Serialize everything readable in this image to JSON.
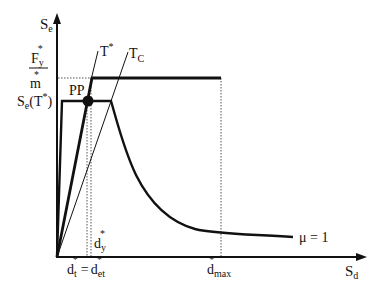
{
  "diagram": {
    "title": "",
    "axes": {
      "y_label": "S",
      "y_label_sub": "e",
      "x_label": "S",
      "x_label_sub": "d"
    },
    "labels": {
      "fy_num": "F",
      "fy_num_sub": "y",
      "fy_num_sup": "*",
      "fy_den": "m",
      "fy_den_sup": "*",
      "se_t": "S",
      "se_t_sub": "e",
      "se_t_paren": "(T",
      "se_t_sup": "*",
      "se_t_close": ")",
      "pp": "PP",
      "t_star": "T",
      "t_star_sup": "*",
      "t_c": "T",
      "t_c_sub": "C",
      "dy": "d",
      "dy_sub": "y",
      "dy_sup": "*",
      "dt": "d",
      "dt_sub": "t",
      "dt_sup": "*",
      "equals": "=",
      "det": "d",
      "det_sub": "et",
      "det_sup": "*",
      "dmax": "d",
      "dmax_sub": "max",
      "dmax_sup": "*",
      "mu": "μ = 1"
    },
    "colors": {
      "line": "#111111",
      "dotted": "#555555",
      "background": "#ffffff"
    }
  }
}
